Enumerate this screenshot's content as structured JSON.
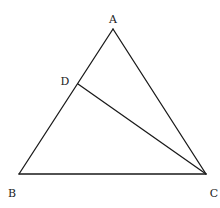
{
  "diagram": {
    "type": "triangle-with-cevian",
    "points": {
      "A": {
        "label": "A",
        "x": 113,
        "y": 29,
        "label_x": 113,
        "label_y": 23
      },
      "B": {
        "label": "B",
        "x": 19,
        "y": 174,
        "label_x": 12,
        "label_y": 197
      },
      "C": {
        "label": "C",
        "x": 206,
        "y": 174,
        "label_x": 214,
        "label_y": 197
      },
      "D": {
        "label": "D",
        "x": 78,
        "y": 84,
        "label_x": 65,
        "label_y": 85
      }
    },
    "segments": [
      {
        "from": "A",
        "to": "B"
      },
      {
        "from": "B",
        "to": "C"
      },
      {
        "from": "C",
        "to": "A"
      },
      {
        "from": "D",
        "to": "C"
      }
    ],
    "colors": {
      "stroke": "#1a1a1a",
      "label": "#222222",
      "background": "#ffffff"
    }
  }
}
